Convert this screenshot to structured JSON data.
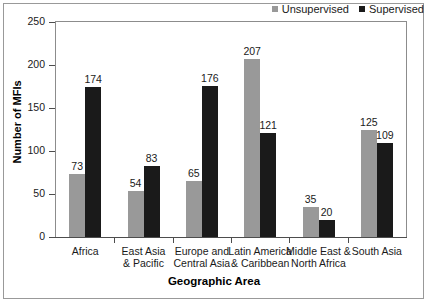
{
  "chart_data": {
    "type": "bar",
    "title": "",
    "xlabel": "Geographic Area",
    "ylabel": "Number of MFIs",
    "ylim": [
      0,
      250
    ],
    "yticks": [
      0,
      50,
      100,
      150,
      200,
      250
    ],
    "grid": false,
    "legend_position": "top-right",
    "categories": [
      "Africa",
      "East Asia & Pacific",
      "Europe and Central Asia",
      "Latin America & Caribbean",
      "Middle East & North Africa",
      "South Asia"
    ],
    "category_lines": [
      [
        "Africa",
        ""
      ],
      [
        "East Asia",
        "& Pacific"
      ],
      [
        "Europe and",
        "Central Asia"
      ],
      [
        "Latin America",
        "& Caribbean"
      ],
      [
        "Middle East &",
        "North Africa"
      ],
      [
        "South Asia",
        ""
      ]
    ],
    "series": [
      {
        "name": "Unsupervised",
        "color": "#999999",
        "values": [
          73,
          54,
          65,
          207,
          35,
          125
        ]
      },
      {
        "name": "Supervised",
        "color": "#1a1a1a",
        "values": [
          174,
          83,
          176,
          121,
          20,
          109
        ]
      }
    ]
  },
  "legend": {
    "items": [
      {
        "label": "Unsupervised",
        "color": "#999999"
      },
      {
        "label": "Supervised",
        "color": "#1a1a1a"
      }
    ]
  },
  "axes": {
    "y_title": "Number of MFIs",
    "x_title": "Geographic Area",
    "y_tick_labels": [
      "250",
      "200",
      "150",
      "100",
      "50",
      "0"
    ]
  }
}
